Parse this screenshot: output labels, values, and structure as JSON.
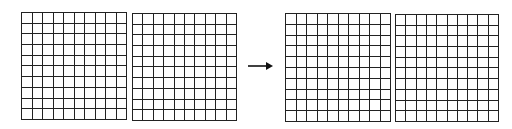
{
  "diagram": {
    "line_color": "#222222",
    "background": "#ffffff",
    "before": {
      "grids": [
        {
          "id": "grid-1",
          "rows": 10,
          "cols": 10,
          "x": 21,
          "y": 12,
          "width": 106,
          "height": 108
        },
        {
          "id": "grid-2",
          "rows": 10,
          "cols": 10,
          "x": 132,
          "y": 13,
          "width": 105,
          "height": 108
        }
      ]
    },
    "arrow": {
      "icon": "right-arrow-icon",
      "x1": 248,
      "x2": 273,
      "y": 66,
      "color": "#111111"
    },
    "after": {
      "grids": [
        {
          "id": "grid-3",
          "rows": 10,
          "cols": 10,
          "x": 285,
          "y": 13,
          "width": 106,
          "height": 109
        },
        {
          "id": "grid-4",
          "rows": 10,
          "cols": 10,
          "x": 395,
          "y": 14,
          "width": 104,
          "height": 108
        }
      ]
    }
  }
}
